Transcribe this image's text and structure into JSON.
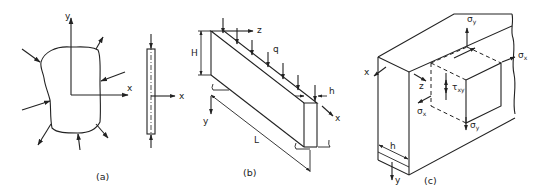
{
  "figure": {
    "panels": [
      {
        "id": "a",
        "caption": "(a)",
        "description": "Arbitrary plane body loaded by in-plane edge forces; thin plate side view",
        "labels": {
          "x_axis": "x",
          "y_axis": "y",
          "side_x_axis": "x"
        }
      },
      {
        "id": "b",
        "caption": "(b)",
        "description": "Deep beam of height H, length L and thickness h under distributed load q",
        "labels": {
          "z_axis": "z",
          "load": "q",
          "height": "H",
          "thickness": "h",
          "x_axis": "x",
          "y_axis": "y",
          "length": "L"
        }
      },
      {
        "id": "c",
        "caption": "(c)",
        "description": "Plate element with stress components on a cut-out cube",
        "labels": {
          "x_axis": "x",
          "z_axis": "z",
          "y_axis": "y",
          "thickness": "h",
          "sigma_y_top": "σ",
          "sigma_y_top_sub": "y",
          "sigma_x_right": "σ",
          "sigma_x_right_sub": "x",
          "tau_xy": "τ",
          "tau_xy_sub": "xy",
          "sigma_x_left": "σ",
          "sigma_x_left_sub": "x",
          "sigma_y_bottom": "σ",
          "sigma_y_bottom_sub": "y"
        }
      }
    ]
  }
}
